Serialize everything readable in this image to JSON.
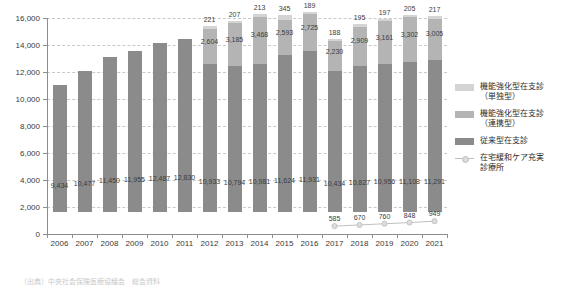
{
  "chart_data": {
    "type": "bar",
    "title": "",
    "xlabel": "",
    "ylabel": "",
    "ylim": [
      0,
      16000
    ],
    "ytick_step": 2000,
    "grid": true,
    "stacked": true,
    "legend_position": "right",
    "categories": [
      "2006",
      "2007",
      "2008",
      "2009",
      "2010",
      "2011",
      "2012",
      "2013",
      "2014",
      "2015",
      "2016",
      "2017",
      "2018",
      "2019",
      "2020",
      "2021"
    ],
    "ytick_labels": [
      "0",
      "2,000",
      "4,000",
      "6,000",
      "8,000",
      "10,000",
      "12,000",
      "14,000",
      "16,000"
    ],
    "series": [
      {
        "name": "従来型在支診",
        "kind": "bar",
        "color": "#8b8b8b",
        "values": [
          9434,
          10477,
          11450,
          11955,
          12487,
          12830,
          10933,
          10794,
          10981,
          11624,
          11931,
          10434,
          10827,
          10956,
          11108,
          11291
        ],
        "labels": [
          "9,434",
          "10,477",
          "11,450",
          "11,955",
          "12,487",
          "12,830",
          "10,933",
          "10,794",
          "10,981",
          "11,624",
          "11,931",
          "10,434",
          "10,827",
          "10,956",
          "11,108",
          "11,291"
        ]
      },
      {
        "name": "機能強化型在支診（連携型）",
        "kind": "bar",
        "color": "#b4b4b4",
        "values": [
          null,
          null,
          null,
          null,
          null,
          null,
          2604,
          3185,
          3468,
          2593,
          2725,
          2230,
          2909,
          3161,
          3302,
          3005
        ],
        "labels": [
          "",
          "",
          "",
          "",
          "",
          "",
          "2,604",
          "3,185",
          "3,468",
          "2,593",
          "2,725",
          "2,230",
          "2,909",
          "3,161",
          "3,302",
          "3,005"
        ]
      },
      {
        "name": "機能強化型在支診（単独型）",
        "kind": "bar",
        "color": "#d4d4d4",
        "values": [
          null,
          null,
          null,
          null,
          null,
          null,
          221,
          207,
          213,
          345,
          189,
          188,
          195,
          197,
          205,
          217
        ],
        "labels": [
          "",
          "",
          "",
          "",
          "",
          "",
          "221",
          "207",
          "213",
          "345",
          "189",
          "188",
          "195",
          "197",
          "205",
          "217"
        ]
      },
      {
        "name": "在宅緩和ケア充実診療所",
        "kind": "line",
        "color": "#c0c0c0",
        "values": [
          null,
          null,
          null,
          null,
          null,
          null,
          null,
          null,
          null,
          null,
          null,
          585,
          670,
          760,
          848,
          949
        ],
        "labels": [
          "",
          "",
          "",
          "",
          "",
          "",
          "",
          "",
          "",
          "",
          "",
          "585",
          "670",
          "760",
          "848",
          "949"
        ]
      }
    ]
  },
  "legend": {
    "items": [
      {
        "marker": "swatch-light",
        "label_line1": "機能強化型在支診",
        "label_line2": "（単独型）"
      },
      {
        "marker": "swatch-mid",
        "label_line1": "機能強化型在支診",
        "label_line2": "（連携型）"
      },
      {
        "marker": "swatch-dark",
        "label_line1": "従来型在支診",
        "label_line2": ""
      },
      {
        "marker": "line-marker",
        "label_line1": "在宅緩和ケア充実",
        "label_line2": "診療所"
      }
    ]
  },
  "caption": {
    "text": "（出典）中央社会保険医療協議会　総会資料"
  }
}
